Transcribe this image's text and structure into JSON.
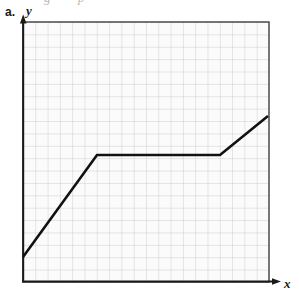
{
  "figure": {
    "item_label": "a.",
    "bleed_top": {
      "glyph_left": "g",
      "glyph_right": "p"
    },
    "axes": {
      "y_label": "y",
      "x_label": "x",
      "y_arrow_name": "y-axis-arrow",
      "x_arrow_name": "x-axis-arrow"
    },
    "colors": {
      "grid_line": "#c9c9c9",
      "grid_border": "#555555",
      "grid_background": "#fbfbfb",
      "curve": "#111111",
      "axis": "#1a1a1a"
    }
  },
  "chart_data": {
    "type": "line",
    "title": "",
    "xlabel": "x",
    "ylabel": "y",
    "grid": true,
    "legend": null,
    "grid_columns": 20,
    "grid_rows": 21,
    "xlim": [
      0,
      20
    ],
    "ylim": [
      0,
      21
    ],
    "axis_tick_labels": {
      "x": [],
      "y": []
    },
    "series": [
      {
        "name": "piecewise-linear-curve",
        "description": "increasing segment, then constant segment, then increasing segment",
        "x": [
          0,
          6,
          16,
          20
        ],
        "y": [
          2,
          10.25,
          10.25,
          13.4
        ],
        "segments": [
          {
            "kind": "increasing",
            "from": [
              0,
              2
            ],
            "to": [
              6,
              10.25
            ]
          },
          {
            "kind": "constant",
            "from": [
              6,
              10.25
            ],
            "to": [
              16,
              10.25
            ]
          },
          {
            "kind": "increasing",
            "from": [
              16,
              10.25
            ],
            "to": [
              20,
              13.4
            ]
          }
        ]
      }
    ],
    "pixel_geometry": {
      "plot_left": 23,
      "plot_right": 269,
      "plot_top": 22,
      "plot_bottom": 282,
      "cell_width": 12.3,
      "cell_height": 12.38,
      "polyline_points": "23,257 97,155 220,155 268,116"
    }
  }
}
